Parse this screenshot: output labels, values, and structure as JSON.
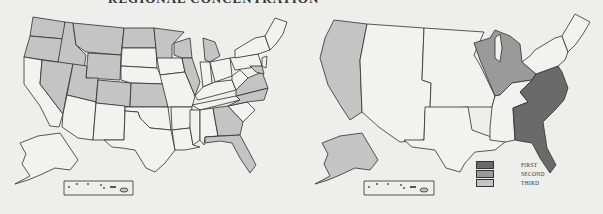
{
  "page": {
    "title": "REGIONAL CONCENTRATION"
  },
  "colors": {
    "background": "#eeeeec",
    "outline": "#2e2e2e",
    "first": "#6a6a6a",
    "second": "#9a9a9a",
    "third": "#c4c4c4",
    "unshaded": "#f2f2f0"
  },
  "left_map": {
    "description": "US states map with individually shaded states",
    "shaded_states": [
      "WA",
      "OR",
      "ID",
      "MT",
      "WY",
      "ND",
      "MN",
      "WI",
      "MI",
      "NV",
      "UT",
      "CO",
      "KS",
      "IL",
      "VA",
      "NC",
      "GA",
      "FL",
      "MD"
    ]
  },
  "right_map": {
    "description": "US regional map",
    "regions": [
      {
        "name": "Southeast",
        "rank": "first"
      },
      {
        "name": "Great Lakes",
        "rank": "second"
      },
      {
        "name": "Far West",
        "rank": "third"
      },
      {
        "name": "Alaska",
        "rank": "third"
      }
    ]
  },
  "legend": {
    "items": [
      {
        "label": "FIRST",
        "color": "#6a6a6a"
      },
      {
        "label": "SECOND",
        "color": "#9a9a9a"
      },
      {
        "label": "THIRD",
        "color": "#c4c4c4"
      }
    ]
  }
}
